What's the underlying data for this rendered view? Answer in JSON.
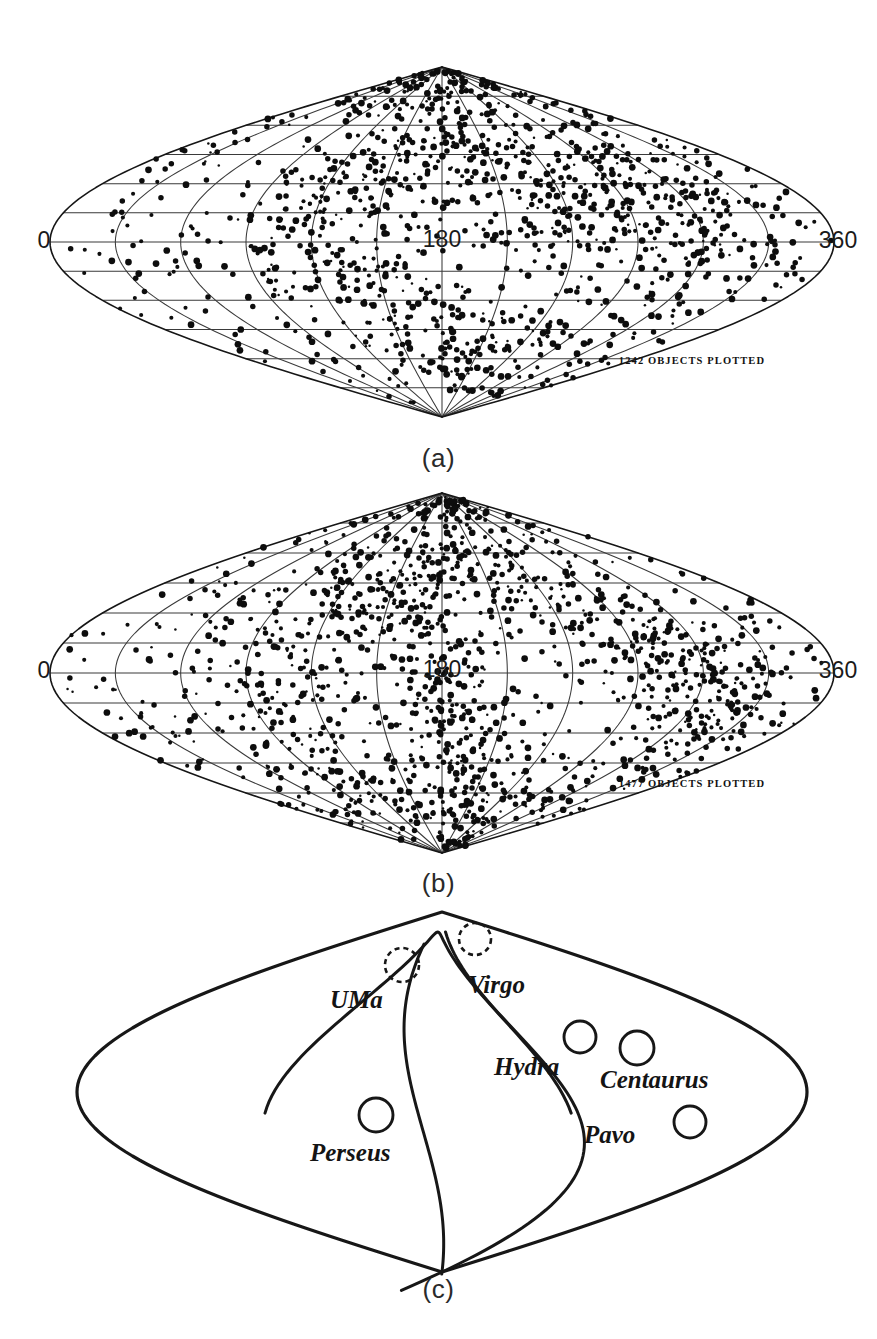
{
  "figure": {
    "background_color": "#ffffff",
    "ink_color": "#111111"
  },
  "panels": [
    {
      "id": "a",
      "label": "(a)",
      "count_text": "1242 OBJECTS PLOTTED",
      "axis_left": "0",
      "axis_center": "180",
      "axis_right": "360",
      "object_count": 1242
    },
    {
      "id": "b",
      "label": "(b)",
      "count_text": "1477 OBJECTS PLOTTED",
      "axis_left": "0",
      "axis_center": "180",
      "axis_right": "360",
      "object_count": 1477
    },
    {
      "id": "c",
      "label": "(c)",
      "clusters": [
        {
          "name": "UMa",
          "marker": "dashed",
          "cx": 402,
          "cy": 965,
          "r": 17,
          "lx": 330,
          "ly": 1008
        },
        {
          "name": "Virgo",
          "marker": "dashed",
          "cx": 475,
          "cy": 939,
          "r": 16,
          "lx": 468,
          "ly": 993
        },
        {
          "name": "Hydra",
          "marker": "solid",
          "cx": 580,
          "cy": 1037,
          "r": 16,
          "lx": 494,
          "ly": 1075
        },
        {
          "name": "Centaurus",
          "marker": "solid",
          "cx": 637,
          "cy": 1048,
          "r": 17,
          "lx": 600,
          "ly": 1088
        },
        {
          "name": "Perseus",
          "marker": "solid",
          "cx": 376,
          "cy": 1115,
          "r": 17,
          "lx": 310,
          "ly": 1161
        },
        {
          "name": "Pavo",
          "marker": "solid",
          "cx": 690,
          "cy": 1122,
          "r": 16,
          "lx": 584,
          "ly": 1143
        }
      ]
    }
  ],
  "chart_data": {
    "type": "scatter",
    "projection": "sinusoidal",
    "xlabel": "Galactic longitude (degrees)",
    "ylabel": "Galactic latitude (degrees)",
    "xlim": [
      0,
      360
    ],
    "ylim": [
      -90,
      90
    ],
    "x_tick_labels": [
      "0",
      "180",
      "360"
    ],
    "x_tick_values": [
      0,
      180,
      360
    ],
    "grid": true,
    "grid_meridian_step_deg": 30,
    "grid_parallel_step_deg": 15,
    "legend": "none",
    "annotations": [
      "1242 OBJECTS PLOTTED",
      "1477 OBJECTS PLOTTED",
      "(a)",
      "(b)",
      "(c)"
    ],
    "series": [
      {
        "name": "Panel (a) galaxies",
        "n_points": 1242,
        "panel": "a",
        "description": "Objects plotted in sinusoidal projection; strong concentration in northern galactic hemisphere and near longitude 240-300.",
        "overdensity_regions": [
          {
            "name": "northern concentration",
            "lon": 180,
            "lat": 55,
            "weight": 0.22
          },
          {
            "name": "right-hand band",
            "lon": 275,
            "lat": 25,
            "weight": 0.26
          },
          {
            "name": "southern clump",
            "lon": 195,
            "lat": -55,
            "weight": 0.14
          },
          {
            "name": "left mid band",
            "lon": 115,
            "lat": 20,
            "weight": 0.1
          }
        ]
      },
      {
        "name": "Panel (b) galaxies",
        "n_points": 1477,
        "panel": "b",
        "description": "Objects plotted in sinusoidal projection; more uniform coverage with dense clumps near longitude 300 and the equatorial band.",
        "overdensity_regions": [
          {
            "name": "northern band",
            "lon": 170,
            "lat": 50,
            "weight": 0.18
          },
          {
            "name": "right clump",
            "lon": 305,
            "lat": -10,
            "weight": 0.2
          },
          {
            "name": "central equatorial band",
            "lon": 185,
            "lat": -25,
            "weight": 0.22
          },
          {
            "name": "southern band",
            "lon": 175,
            "lat": -60,
            "weight": 0.16
          }
        ]
      },
      {
        "name": "Panel (c) cluster schematic",
        "panel": "c",
        "points": [
          {
            "label": "UMa",
            "lon": 140,
            "lat": 62,
            "marker": "dashed-circle"
          },
          {
            "label": "Virgo",
            "lon": 175,
            "lat": 72,
            "marker": "dashed-circle"
          },
          {
            "label": "Hydra",
            "lon": 245,
            "lat": 28,
            "marker": "open-circle"
          },
          {
            "label": "Centaurus",
            "lon": 270,
            "lat": 22,
            "marker": "open-circle"
          },
          {
            "label": "Perseus",
            "lon": 132,
            "lat": -18,
            "marker": "open-circle"
          },
          {
            "label": "Pavo",
            "lon": 295,
            "lat": -25,
            "marker": "open-circle"
          }
        ]
      }
    ]
  }
}
